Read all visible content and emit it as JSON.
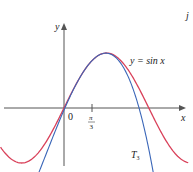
{
  "chart_data": {
    "type": "line",
    "title": "",
    "xlabel": "x",
    "ylabel": "y",
    "xlim": [
      -2.35,
      4.6
    ],
    "ylim": [
      -1.15,
      1.95
    ],
    "grid": false,
    "ticks": {
      "x": [
        {
          "value": 1.0472,
          "label": "π/3"
        }
      ],
      "origin_label": "0"
    },
    "series": [
      {
        "name": "y = sin x",
        "color": "#d9415a",
        "function": "sin(x)",
        "x": [
          -2.35,
          -2.0,
          -1.6,
          -1.2,
          -0.8,
          -0.4,
          0.0,
          0.4,
          0.8,
          1.2,
          1.5708,
          2.0,
          2.4,
          2.8,
          3.1416,
          3.5,
          3.9,
          4.3,
          4.6
        ],
        "y": [
          -0.711,
          -0.909,
          -0.9996,
          -0.932,
          -0.717,
          -0.389,
          0.0,
          0.389,
          0.717,
          0.932,
          1.0,
          0.909,
          0.675,
          0.335,
          0.0,
          -0.351,
          -0.688,
          -0.916,
          -0.994
        ]
      },
      {
        "name": "T3",
        "color": "#3a66b8",
        "function": "sqrt(3)/2 + (x-π/3)/2 - sqrt(3)/4 (x-π/3)^2 - (x-π/3)^3/12",
        "x": [
          -0.95,
          -0.6,
          -0.3,
          0.0,
          0.4,
          0.8,
          1.0472,
          1.3,
          1.5708,
          1.9,
          2.2,
          2.5,
          2.8,
          3.1,
          3.4,
          3.65
        ],
        "y": [
          -0.77,
          -0.53,
          -0.29,
          -0.0003,
          0.389,
          0.717,
          0.866,
          0.964,
          0.9995,
          0.944,
          0.806,
          0.586,
          0.27,
          -0.15,
          -0.71,
          -1.28
        ]
      }
    ],
    "annotations": [
      {
        "text": "y = sin x",
        "near": "sin curve peak, right side"
      },
      {
        "text": "T",
        "subscript": "3",
        "near": "blue curve lower right"
      }
    ]
  },
  "labels": {
    "y_axis": "y",
    "x_axis": "x",
    "origin": "0",
    "tick_num": "π",
    "tick_den": "3",
    "sin_label": "y = sin x",
    "t3_main": "T",
    "t3_sub": "3",
    "corner_fragment": "j"
  }
}
